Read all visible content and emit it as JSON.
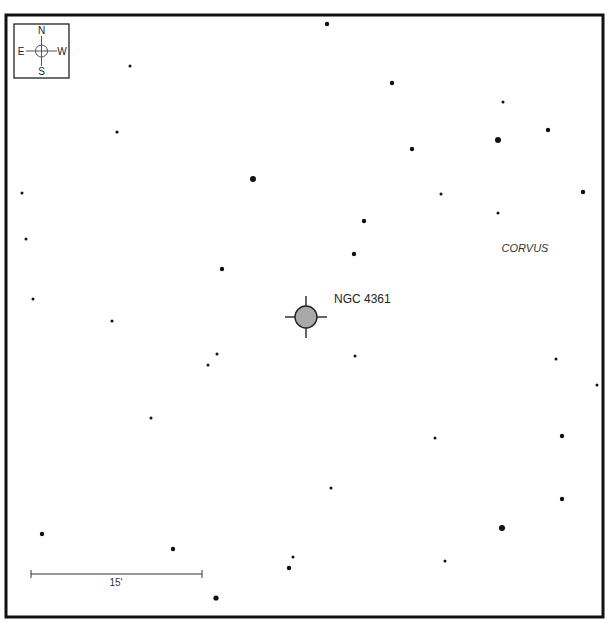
{
  "object": {
    "label": "NGC 4361",
    "x": 306,
    "y": 317,
    "r": 11,
    "tick": 10,
    "fill": "#a9a9a9",
    "label_x": 334,
    "label_y": 303
  },
  "constellation": {
    "label": "CORVUS",
    "x": 525,
    "y": 252
  },
  "compass": {
    "n": "N",
    "s": "S",
    "e": "E",
    "w": "W",
    "x": 14,
    "y": 24,
    "w_px": 55,
    "h_px": 54
  },
  "scale_bar": {
    "label": "15'",
    "x1": 31,
    "x2": 202,
    "y": 574,
    "label_x": 116,
    "label_y": 586
  },
  "frame": {
    "x": 6,
    "y": 15,
    "w": 597,
    "h": 602,
    "stroke": "#111111"
  },
  "stars": [
    [
      327,
      24,
      2.2
    ],
    [
      130,
      66,
      1.5
    ],
    [
      392,
      83,
      2.2
    ],
    [
      503,
      102,
      1.5
    ],
    [
      117,
      132,
      1.6
    ],
    [
      548,
      130,
      2.2
    ],
    [
      498,
      140,
      3.0
    ],
    [
      412,
      149,
      2.2
    ],
    [
      253,
      179,
      3.0
    ],
    [
      22,
      193,
      1.5
    ],
    [
      441,
      194,
      1.5
    ],
    [
      583,
      192,
      2.2
    ],
    [
      498,
      213,
      1.5
    ],
    [
      364,
      221,
      2.2
    ],
    [
      26,
      239,
      1.5
    ],
    [
      354,
      254,
      2.2
    ],
    [
      222,
      269,
      2.2
    ],
    [
      33,
      299,
      1.5
    ],
    [
      112,
      321,
      1.5
    ],
    [
      217,
      354,
      1.5
    ],
    [
      355,
      356,
      1.5
    ],
    [
      208,
      365,
      1.5
    ],
    [
      556,
      359,
      1.5
    ],
    [
      597,
      385,
      1.5
    ],
    [
      151,
      418,
      1.5
    ],
    [
      435,
      438,
      1.5
    ],
    [
      562,
      436,
      2.2
    ],
    [
      331,
      488,
      1.5
    ],
    [
      562,
      499,
      2.2
    ],
    [
      42,
      534,
      2.2
    ],
    [
      502,
      528,
      3.0
    ],
    [
      173,
      549,
      2.2
    ],
    [
      293,
      557,
      1.5
    ],
    [
      289,
      568,
      2.2
    ],
    [
      445,
      561,
      1.5
    ],
    [
      216,
      598,
      2.6
    ]
  ]
}
